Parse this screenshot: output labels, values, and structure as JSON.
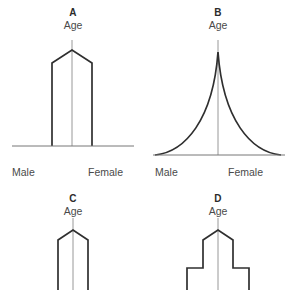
{
  "figure": {
    "background_color": "#ffffff",
    "outline_color": "#2f2f2f",
    "axis_color": "#777777",
    "center_line_color": "#8d8d8d",
    "text_color": "#4a4a4a"
  },
  "panels": [
    {
      "id": "a",
      "letter": "A",
      "age_label": "Age",
      "male_label": "Male",
      "female_label": "Female",
      "shape": "columnar",
      "has_baseline": true,
      "outline_points": "52,146 52,63 72,50 92,63 92,146",
      "center_x": 72,
      "center_top_y": 40,
      "center_bottom_y": 146,
      "baseline_x1": 12,
      "baseline_x2": 134,
      "baseline_y": 146
    },
    {
      "id": "b",
      "letter": "B",
      "age_label": "Age",
      "male_label": "Male",
      "female_label": "Female",
      "shape": "expansive",
      "has_baseline": true,
      "curve_path": "M 10,155 C 40,152 68,120 73,52 C 78,120 106,152 136,155",
      "center_x": 73,
      "center_top_y": 40,
      "center_bottom_y": 155,
      "baseline_x1": 8,
      "baseline_x2": 140,
      "baseline_y": 155
    },
    {
      "id": "c",
      "letter": "C",
      "age_label": "Age",
      "male_label": "",
      "female_label": "",
      "shape": "constrictive",
      "has_baseline": false,
      "outline_points": "58,100 58,50 73,40 88,50 88,100",
      "center_x": 73,
      "center_top_y": 28,
      "center_bottom_y": 100
    },
    {
      "id": "d",
      "letter": "D",
      "age_label": "Age",
      "male_label": "",
      "female_label": "",
      "shape": "stepped",
      "has_baseline": false,
      "outline_points": "42,100 42,78 58,78 58,50 73,40 88,50 88,78 104,78 104,100",
      "center_x": 73,
      "center_top_y": 28,
      "center_bottom_y": 100
    }
  ]
}
